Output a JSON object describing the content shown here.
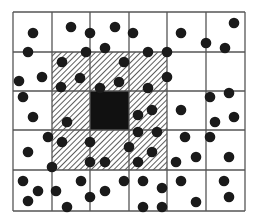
{
  "diagram": {
    "type": "grid-neighborhood-dot-diagram",
    "grid": {
      "x_lines": [
        13,
        52,
        90,
        129,
        167,
        206,
        245
      ],
      "y_lines": [
        12,
        52,
        91,
        130,
        170,
        211
      ],
      "columns": 6,
      "rows": 5,
      "line_color": "#555555"
    },
    "hatched_region": {
      "col_start": 1,
      "col_end": 3,
      "row_start": 1,
      "row_end": 3,
      "pattern": "diagonal-hatch",
      "color": "#333333"
    },
    "center_cell": {
      "col": 2,
      "row": 2,
      "fill": "#111111"
    },
    "dot_radius": 5.3,
    "dot_color": "#1a1a1a",
    "dots": [
      [
        33,
        33
      ],
      [
        28,
        52
      ],
      [
        71,
        27
      ],
      [
        90,
        33
      ],
      [
        115,
        27
      ],
      [
        62,
        62
      ],
      [
        86,
        52
      ],
      [
        105,
        48
      ],
      [
        124,
        62
      ],
      [
        19,
        81
      ],
      [
        42,
        77
      ],
      [
        80,
        78
      ],
      [
        61,
        87
      ],
      [
        100,
        88
      ],
      [
        119,
        82
      ],
      [
        23,
        97
      ],
      [
        133,
        33
      ],
      [
        181,
        33
      ],
      [
        234,
        23
      ],
      [
        148,
        52
      ],
      [
        167,
        52
      ],
      [
        206,
        43
      ],
      [
        225,
        48
      ],
      [
        167,
        77
      ],
      [
        148,
        88
      ],
      [
        210,
        97
      ],
      [
        229,
        93
      ],
      [
        33,
        117
      ],
      [
        67,
        122
      ],
      [
        48,
        137
      ],
      [
        62,
        142
      ],
      [
        90,
        142
      ],
      [
        28,
        152
      ],
      [
        52,
        167
      ],
      [
        90,
        162
      ],
      [
        105,
        162
      ],
      [
        23,
        181
      ],
      [
        38,
        191
      ],
      [
        28,
        201
      ],
      [
        56,
        191
      ],
      [
        81,
        181
      ],
      [
        90,
        197
      ],
      [
        67,
        207
      ],
      [
        105,
        191
      ],
      [
        124,
        181
      ],
      [
        138,
        115
      ],
      [
        152,
        110
      ],
      [
        181,
        110
      ],
      [
        215,
        122
      ],
      [
        234,
        117
      ],
      [
        138,
        132
      ],
      [
        157,
        132
      ],
      [
        185,
        137
      ],
      [
        210,
        137
      ],
      [
        129,
        147
      ],
      [
        152,
        152
      ],
      [
        138,
        162
      ],
      [
        176,
        162
      ],
      [
        196,
        157
      ],
      [
        229,
        157
      ],
      [
        143,
        181
      ],
      [
        162,
        188
      ],
      [
        181,
        181
      ],
      [
        224,
        181
      ],
      [
        143,
        207
      ],
      [
        162,
        207
      ],
      [
        196,
        202
      ],
      [
        229,
        197
      ]
    ]
  }
}
